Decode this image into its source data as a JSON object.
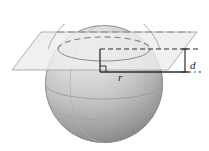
{
  "figure": {
    "labels": {
      "radius": "r",
      "distance": "d"
    },
    "colors": {
      "sphere_light": "#e8e8e8",
      "sphere_mid": "#c6c6c6",
      "sphere_dark": "#8f8f8f",
      "plane_fill": "#ebebeb",
      "plane_stroke": "#a8a8a8",
      "line_dark": "#333333",
      "line_mid": "#6f6f6f",
      "background": "#ffffff",
      "label_color": "#1a1a1a"
    },
    "geometry": {
      "sphere_center_x": 104,
      "sphere_center_y": 84,
      "sphere_radius": 59,
      "plane_corners": "12,70 41,32 197,32 168,70",
      "cross_section_center_x": 104,
      "cross_section_center_y": 49,
      "cross_section_rx": 46,
      "cross_section_ry": 12,
      "radius_line_y": 72,
      "dimension_top_y": 49,
      "dimension_bottom_y": 72,
      "dimension_x": 185
    }
  }
}
